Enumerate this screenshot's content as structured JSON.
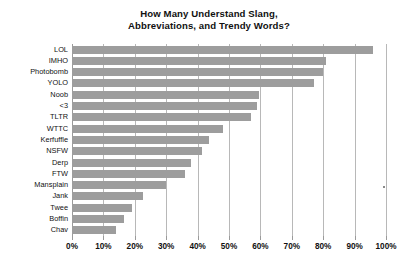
{
  "chart_data": {
    "type": "bar",
    "orientation": "horizontal",
    "title": "How Many Understand Slang, Abbreviations, and Trendy Words?",
    "title_lines": [
      "How Many Understand Slang,",
      "Abbreviations, and Trendy Words?"
    ],
    "xlabel": "",
    "ylabel": "",
    "xlim": [
      0,
      100
    ],
    "grid": true,
    "legend": false,
    "bar_color": "#9d9d9d",
    "gridline_color": "#b8b8b8",
    "categories": [
      "LOL",
      "IMHO",
      "Photobomb",
      "YOLO",
      "Noob",
      "<3",
      "TLTR",
      "WTTC",
      "Kerfuffle",
      "NSFW",
      "Derp",
      "FTW",
      "Mansplain",
      "Jank",
      "Twee",
      "Boffin",
      "Chav"
    ],
    "values": [
      96,
      81,
      80,
      77,
      59.5,
      59,
      57,
      48,
      43.5,
      41.5,
      38,
      36,
      30,
      22.5,
      19,
      16.5,
      14
    ],
    "tick_values": [
      0,
      10,
      20,
      30,
      40,
      50,
      60,
      70,
      80,
      90,
      100
    ],
    "tick_labels": [
      "0%",
      "10%",
      "20%",
      "30%",
      "40%",
      "50%",
      "60%",
      "70%",
      "80%",
      "90%",
      "100%"
    ]
  }
}
